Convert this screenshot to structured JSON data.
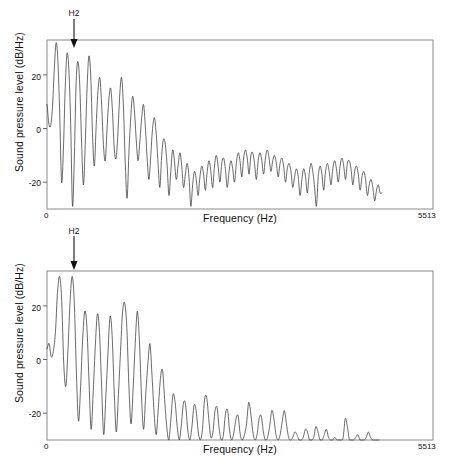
{
  "figure": {
    "background_color": "#ffffff",
    "trace_color": "#3a3a3a",
    "frame_color": "#8a8a8a",
    "panel_count": 2
  },
  "chart_data": [
    {
      "type": "line",
      "panel_id": "top",
      "title": "",
      "xlabel": "Frequency (Hz)",
      "ylabel": "Sound pressure level (dB/Hz)",
      "xlim": [
        0,
        5513
      ],
      "ylim": [
        -30,
        33
      ],
      "xticks": [
        0,
        5513
      ],
      "xticklabels": [
        "0",
        "5513"
      ],
      "yticks": [
        20,
        0,
        -20
      ],
      "yticklabels": [
        "20",
        "0",
        "-20"
      ],
      "grid": false,
      "legend": "none",
      "annotations": [
        {
          "text": "H2",
          "x": 420,
          "y": 33,
          "arrow": "down",
          "note": "arrow points to second harmonic peak"
        }
      ],
      "series": [
        {
          "name": "spectrum-breathy",
          "x": [
            0,
            25,
            52,
            78,
            104,
            130,
            156,
            182,
            208,
            234,
            260,
            286,
            312,
            338,
            364,
            390,
            416,
            442,
            468,
            494,
            520,
            546,
            572,
            598,
            624,
            650,
            676,
            702,
            728,
            754,
            780,
            806,
            832,
            858,
            884,
            910,
            936,
            962,
            988,
            1014,
            1040,
            1066,
            1092,
            1118,
            1144,
            1170,
            1196,
            1222,
            1248,
            1274,
            1300,
            1326,
            1352,
            1378,
            1404,
            1430,
            1456,
            1482,
            1508,
            1534,
            1560,
            1586,
            1612,
            1638,
            1664,
            1690,
            1716,
            1742,
            1768,
            1794,
            1820,
            1846,
            1872,
            1898,
            1924,
            1950,
            1976,
            2002,
            2028,
            2054,
            2080,
            2106,
            2132,
            2158,
            2184,
            2210,
            2236,
            2262,
            2288,
            2314,
            2340,
            2366,
            2392,
            2418,
            2444,
            2470,
            2496,
            2522,
            2548,
            2574,
            2600,
            2626,
            2652,
            2678,
            2704,
            2730,
            2756,
            2782,
            2808,
            2834,
            2860,
            2886,
            2912,
            2938,
            2964,
            2990,
            3016,
            3042,
            3068,
            3094,
            3120,
            3146,
            3172,
            3198,
            3224,
            3250,
            3276,
            3302,
            3328,
            3354,
            3380,
            3406,
            3432,
            3458,
            3484,
            3510,
            3536,
            3562,
            3588,
            3614,
            3640,
            3666,
            3692,
            3718,
            3744,
            3770,
            3796,
            3822,
            3848,
            3874,
            3900,
            3926,
            3952,
            3978,
            4004,
            4030,
            4056,
            4082,
            4108,
            4134,
            4160,
            4186,
            4212,
            4238,
            4264,
            4290,
            4316,
            4342,
            4368,
            4394,
            4420,
            4446,
            4472,
            4498,
            4524,
            4550,
            4576,
            4602,
            4628,
            4654,
            4680,
            4706,
            4732,
            4758,
            4784
          ],
          "y": [
            9,
            2,
            1,
            8,
            22,
            32,
            25,
            5,
            -20,
            -8,
            15,
            28,
            22,
            2,
            -29,
            -11,
            17,
            25,
            16,
            -5,
            -21,
            -6,
            15,
            27,
            20,
            -2,
            -14,
            1,
            14,
            19,
            9,
            -6,
            -12,
            0,
            11,
            15,
            6,
            -8,
            -11,
            -1,
            13,
            19,
            8,
            -13,
            -26,
            -9,
            4,
            12,
            7,
            -4,
            -12,
            -5,
            4,
            9,
            1,
            -11,
            -19,
            -10,
            0,
            4,
            -2,
            -13,
            -22,
            -10,
            -4,
            -6,
            -14,
            -25,
            -16,
            -8,
            -12,
            -19,
            -14,
            -9,
            -14,
            -22,
            -17,
            -13,
            -18,
            -29,
            -21,
            -16,
            -19,
            -25,
            -18,
            -14,
            -17,
            -23,
            -16,
            -12,
            -16,
            -22,
            -14,
            -10,
            -14,
            -20,
            -13,
            -11,
            -15,
            -22,
            -16,
            -12,
            -15,
            -20,
            -13,
            -9,
            -12,
            -18,
            -11,
            -8,
            -11,
            -17,
            -10,
            -9,
            -13,
            -19,
            -12,
            -9,
            -12,
            -17,
            -11,
            -8,
            -11,
            -16,
            -12,
            -10,
            -13,
            -18,
            -13,
            -11,
            -14,
            -20,
            -15,
            -13,
            -16,
            -22,
            -18,
            -15,
            -18,
            -25,
            -19,
            -15,
            -18,
            -24,
            -17,
            -13,
            -16,
            -22,
            -29,
            -18,
            -14,
            -17,
            -23,
            -16,
            -13,
            -16,
            -21,
            -15,
            -12,
            -15,
            -20,
            -14,
            -11,
            -14,
            -19,
            -13,
            -12,
            -15,
            -21,
            -16,
            -14,
            -17,
            -23,
            -18,
            -16,
            -19,
            -25,
            -21,
            -19,
            -22,
            -27,
            -23,
            -21,
            -24
          ]
        }
      ]
    },
    {
      "type": "line",
      "panel_id": "bottom",
      "title": "",
      "xlabel": "Frequency (Hz)",
      "ylabel": "Sound pressure level (dB/Hz)",
      "xlim": [
        0,
        5513
      ],
      "ylim": [
        -30,
        33
      ],
      "xticks": [
        0,
        5513
      ],
      "xticklabels": [
        "0",
        "5513"
      ],
      "yticks": [
        20,
        0,
        -20
      ],
      "yticklabels": [
        "20",
        "0",
        "-20"
      ],
      "grid": false,
      "legend": "none",
      "annotations": [
        {
          "text": "H2",
          "x": 420,
          "y": 33,
          "arrow": "down",
          "note": "arrow points to second harmonic peak"
        }
      ],
      "series": [
        {
          "name": "spectrum-modal",
          "x": [
            0,
            30,
            60,
            90,
            120,
            150,
            180,
            210,
            240,
            270,
            300,
            330,
            360,
            390,
            420,
            450,
            480,
            510,
            540,
            570,
            600,
            630,
            660,
            690,
            720,
            750,
            780,
            810,
            840,
            870,
            900,
            930,
            960,
            990,
            1020,
            1050,
            1080,
            1110,
            1140,
            1170,
            1200,
            1230,
            1260,
            1290,
            1320,
            1350,
            1380,
            1410,
            1440,
            1470,
            1500,
            1530,
            1560,
            1590,
            1620,
            1650,
            1680,
            1710,
            1740,
            1770,
            1800,
            1830,
            1860,
            1890,
            1920,
            1950,
            1980,
            2010,
            2040,
            2070,
            2100,
            2130,
            2160,
            2190,
            2220,
            2250,
            2280,
            2310,
            2340,
            2370,
            2400,
            2430,
            2460,
            2490,
            2520,
            2550,
            2580,
            2610,
            2640,
            2670,
            2700,
            2730,
            2760,
            2790,
            2820,
            2850,
            2880,
            2910,
            2940,
            2970,
            3000,
            3030,
            3060,
            3090,
            3120,
            3150,
            3180,
            3210,
            3240,
            3270,
            3300,
            3330,
            3360,
            3390,
            3420,
            3450,
            3480,
            3510,
            3540,
            3570,
            3600,
            3630,
            3660,
            3690,
            3720,
            3750,
            3780,
            3810,
            3840,
            3870,
            3900,
            3930,
            3960,
            3990,
            4020,
            4050,
            4080,
            4110,
            4140,
            4170,
            4200,
            4230,
            4260,
            4290,
            4320,
            4350,
            4380,
            4410,
            4440,
            4470,
            4500,
            4530,
            4560,
            4590,
            4620,
            4650,
            4680,
            4710,
            4740
          ],
          "y": [
            4,
            6,
            1,
            3,
            10,
            25,
            31,
            22,
            -2,
            -10,
            4,
            22,
            31,
            21,
            -5,
            -23,
            -10,
            8,
            18,
            12,
            -8,
            -26,
            -12,
            5,
            17,
            10,
            -10,
            -28,
            -14,
            2,
            16,
            9,
            -12,
            -27,
            -13,
            3,
            18,
            21,
            12,
            -10,
            -24,
            -11,
            6,
            18,
            7,
            -14,
            -26,
            -13,
            -2,
            6,
            -6,
            -20,
            -28,
            -18,
            -7,
            -4,
            -15,
            -25,
            -30,
            -22,
            -13,
            -16,
            -25,
            -30,
            -24,
            -16,
            -17,
            -26,
            -30,
            -25,
            -17,
            -19,
            -27,
            -30,
            -26,
            -15,
            -14,
            -22,
            -29,
            -27,
            -19,
            -18,
            -26,
            -30,
            -28,
            -20,
            -19,
            -27,
            -30,
            -27,
            -22,
            -21,
            -28,
            -30,
            -28,
            -24,
            -16,
            -20,
            -27,
            -30,
            -28,
            -22,
            -21,
            -27,
            -30,
            -29,
            -25,
            -19,
            -22,
            -28,
            -30,
            -28,
            -23,
            -19,
            -24,
            -29,
            -30,
            -29,
            -27,
            -28,
            -30,
            -30,
            -29,
            -26,
            -27,
            -30,
            -30,
            -29,
            -25,
            -27,
            -30,
            -30,
            -28,
            -26,
            -29,
            -30,
            -30,
            -29,
            -30,
            -30,
            -30,
            -29,
            -22,
            -25,
            -30,
            -30,
            -30,
            -29,
            -28,
            -30,
            -30,
            -30,
            -29,
            -27,
            -29,
            -30,
            -30,
            -30,
            -30
          ]
        }
      ]
    }
  ],
  "panels": {
    "top": {
      "y_axis_title": "Sound pressure level (dB/Hz)",
      "x_axis_title": "Frequency (Hz)",
      "x_min_label": "0",
      "x_max_label": "5513",
      "y_tick_labels": [
        "20",
        "0",
        "-20"
      ],
      "annotation_label": "H2"
    },
    "bottom": {
      "y_axis_title": "Sound pressure level (dB/Hz)",
      "x_axis_title": "Frequency (Hz)",
      "x_min_label": "0",
      "x_max_label": "5513",
      "y_tick_labels": [
        "20",
        "0",
        "-20"
      ],
      "annotation_label": "H2"
    }
  }
}
